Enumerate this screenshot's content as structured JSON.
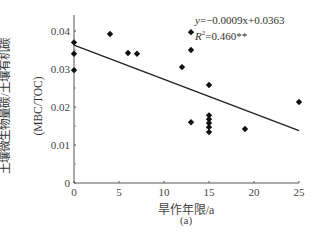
{
  "chart_data": {
    "type": "scatter",
    "title": "",
    "xlabel": "旱作年限/a",
    "ylabel": "土壤微生物量碳/土壤有机碳",
    "ylabel_line2": "(MBC/TOC)",
    "panel_label": "(a)",
    "xlim": [
      0,
      25
    ],
    "ylim": [
      0,
      0.045
    ],
    "x_ticks": [
      "0",
      "5",
      "10",
      "15",
      "20",
      "25"
    ],
    "y_ticks": [
      "0",
      "0.01",
      "0.02",
      "0.03",
      "0.04"
    ],
    "grid": false,
    "legend": null,
    "points": [
      {
        "x": 0,
        "y": 0.037
      },
      {
        "x": 0,
        "y": 0.034
      },
      {
        "x": 0,
        "y": 0.0297
      },
      {
        "x": 4,
        "y": 0.0392
      },
      {
        "x": 6,
        "y": 0.0342
      },
      {
        "x": 7,
        "y": 0.034
      },
      {
        "x": 12,
        "y": 0.0305
      },
      {
        "x": 13,
        "y": 0.0397
      },
      {
        "x": 13,
        "y": 0.035
      },
      {
        "x": 13,
        "y": 0.016
      },
      {
        "x": 15,
        "y": 0.0258
      },
      {
        "x": 15,
        "y": 0.0178
      },
      {
        "x": 15,
        "y": 0.0168
      },
      {
        "x": 15,
        "y": 0.0158
      },
      {
        "x": 15,
        "y": 0.0147
      },
      {
        "x": 15,
        "y": 0.0134
      },
      {
        "x": 19,
        "y": 0.0142
      },
      {
        "x": 25,
        "y": 0.0213
      }
    ],
    "regression": {
      "slope": -0.0009,
      "intercept": 0.0363,
      "x_range": [
        0,
        25
      ]
    },
    "annotations": {
      "equation_prefix": "y",
      "equation_body": "=−0.0009x+0.0363",
      "r2_prefix": "R",
      "r2_body": "=0.460**"
    }
  }
}
